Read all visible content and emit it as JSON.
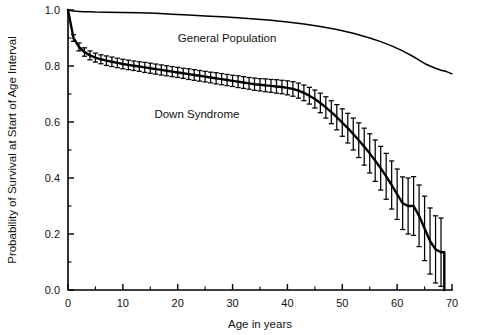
{
  "chart_data": {
    "type": "line",
    "title": "",
    "xlabel": "Age in years",
    "ylabel": "Probability of Survival at Start of Age Interval",
    "xlim": [
      0,
      70
    ],
    "ylim": [
      0.0,
      1.0
    ],
    "xticks": [
      0,
      10,
      20,
      30,
      40,
      50,
      60,
      70
    ],
    "xtick_labels": [
      "0",
      "10",
      "20",
      "30",
      "40",
      "50",
      "60",
      "70"
    ],
    "xtick_minor_step": 5,
    "yticks": [
      0.0,
      0.2,
      0.4,
      0.6,
      0.8,
      1.0
    ],
    "ytick_labels": [
      "0.0",
      "0.2",
      "0.4",
      "0.6",
      "0.8",
      "1.0"
    ],
    "ytick_minor_step": 0.1,
    "grid": false,
    "legend": "annotations-inline",
    "annotations": [
      {
        "text": "General Population",
        "x": 29.0,
        "y": 0.885
      },
      {
        "text": "Down Syndrome",
        "x": 23.5,
        "y": 0.615
      }
    ],
    "series": [
      {
        "name": "General Population",
        "has_error_bars": false,
        "x": [
          0,
          1,
          2,
          3,
          4,
          5,
          7,
          10,
          13,
          16,
          19,
          22,
          25,
          28,
          31,
          34,
          37,
          40,
          43,
          46,
          49,
          52,
          55,
          57,
          59,
          61,
          63,
          64,
          65,
          66,
          67,
          68,
          69,
          70
        ],
        "y": [
          1.0,
          0.996,
          0.995,
          0.994,
          0.994,
          0.993,
          0.992,
          0.991,
          0.99,
          0.988,
          0.985,
          0.982,
          0.979,
          0.976,
          0.972,
          0.968,
          0.963,
          0.957,
          0.95,
          0.941,
          0.93,
          0.917,
          0.9,
          0.887,
          0.872,
          0.854,
          0.833,
          0.821,
          0.809,
          0.8,
          0.792,
          0.785,
          0.78,
          0.772
        ]
      },
      {
        "name": "Down Syndrome",
        "has_error_bars": true,
        "x": [
          0,
          1,
          2,
          3,
          4,
          5,
          6,
          7,
          8,
          9,
          10,
          11,
          12,
          13,
          14,
          15,
          16,
          17,
          18,
          19,
          20,
          21,
          22,
          23,
          24,
          25,
          26,
          27,
          28,
          29,
          30,
          31,
          32,
          33,
          34,
          35,
          36,
          37,
          38,
          39,
          40,
          41,
          42,
          43,
          44,
          45,
          46,
          47,
          48,
          49,
          50,
          51,
          52,
          53,
          54,
          55,
          56,
          57,
          58,
          59,
          60,
          61,
          62,
          63,
          64,
          65,
          66,
          67,
          68
        ],
        "y": [
          1.0,
          0.9,
          0.868,
          0.85,
          0.838,
          0.83,
          0.824,
          0.819,
          0.815,
          0.811,
          0.807,
          0.804,
          0.801,
          0.798,
          0.795,
          0.792,
          0.789,
          0.786,
          0.783,
          0.78,
          0.777,
          0.774,
          0.771,
          0.768,
          0.765,
          0.762,
          0.759,
          0.756,
          0.753,
          0.75,
          0.747,
          0.744,
          0.741,
          0.738,
          0.735,
          0.733,
          0.731,
          0.729,
          0.727,
          0.725,
          0.722,
          0.718,
          0.712,
          0.704,
          0.694,
          0.682,
          0.668,
          0.652,
          0.635,
          0.617,
          0.598,
          0.578,
          0.557,
          0.535,
          0.512,
          0.488,
          0.462,
          0.435,
          0.406,
          0.375,
          0.342,
          0.31,
          0.3,
          0.3,
          0.265,
          0.22,
          0.175,
          0.145,
          0.135
        ],
        "yerr_lower": [
          0.0,
          0.012,
          0.014,
          0.015,
          0.016,
          0.016,
          0.016,
          0.017,
          0.017,
          0.017,
          0.017,
          0.017,
          0.017,
          0.017,
          0.018,
          0.018,
          0.018,
          0.018,
          0.018,
          0.018,
          0.018,
          0.018,
          0.019,
          0.019,
          0.019,
          0.019,
          0.019,
          0.02,
          0.02,
          0.02,
          0.02,
          0.021,
          0.021,
          0.021,
          0.022,
          0.022,
          0.023,
          0.023,
          0.024,
          0.024,
          0.025,
          0.026,
          0.027,
          0.028,
          0.03,
          0.032,
          0.035,
          0.038,
          0.041,
          0.045,
          0.049,
          0.053,
          0.057,
          0.062,
          0.066,
          0.07,
          0.074,
          0.078,
          0.082,
          0.086,
          0.09,
          0.094,
          0.1,
          0.105,
          0.11,
          0.115,
          0.118,
          0.12,
          0.122
        ],
        "yerr_upper": [
          0.0,
          0.012,
          0.014,
          0.015,
          0.016,
          0.016,
          0.016,
          0.017,
          0.017,
          0.017,
          0.017,
          0.017,
          0.017,
          0.017,
          0.018,
          0.018,
          0.018,
          0.018,
          0.018,
          0.018,
          0.018,
          0.018,
          0.019,
          0.019,
          0.019,
          0.019,
          0.019,
          0.02,
          0.02,
          0.02,
          0.02,
          0.021,
          0.021,
          0.021,
          0.022,
          0.022,
          0.023,
          0.023,
          0.024,
          0.024,
          0.025,
          0.026,
          0.027,
          0.028,
          0.03,
          0.032,
          0.035,
          0.038,
          0.041,
          0.045,
          0.049,
          0.053,
          0.057,
          0.062,
          0.066,
          0.07,
          0.074,
          0.078,
          0.082,
          0.086,
          0.09,
          0.094,
          0.1,
          0.105,
          0.11,
          0.115,
          0.118,
          0.12,
          0.122
        ]
      }
    ]
  },
  "colors": {
    "background": "#ffffff",
    "ink": "#000000",
    "text": "#111111"
  }
}
